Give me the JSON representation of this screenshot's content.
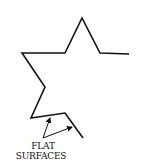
{
  "diagram": {
    "type": "line-drawing",
    "stroke_color": "#111111",
    "label": {
      "line1": "FLAT",
      "line2": "SURFACES"
    },
    "outline_points": "129,54 100,53 82,18 65,53 22,53 45,87 31,118 65,113 83,138",
    "arrows": [
      {
        "from": [
          43,
          138
        ],
        "to": [
          50,
          117
        ]
      },
      {
        "from": [
          43,
          138
        ],
        "to": [
          73,
          127
        ]
      }
    ]
  }
}
